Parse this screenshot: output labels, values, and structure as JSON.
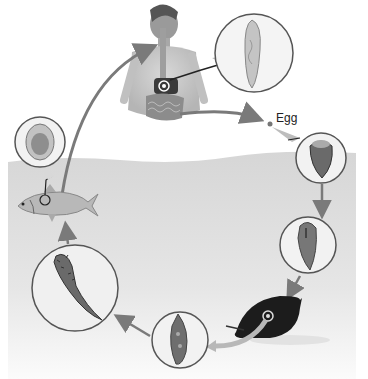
{
  "diagram": {
    "type": "life-cycle",
    "colors": {
      "background": "#ffffff",
      "water": "#dcdcdc",
      "arrow": "#7a7a7a",
      "circle_border": "#555555",
      "circle_fill": "#f2f2f2",
      "snail": "#1c1c1c"
    },
    "labels": {
      "egg": "Egg"
    },
    "stages": [
      {
        "id": "human-host",
        "icon": "human-torso-icon"
      },
      {
        "id": "adult-fluke",
        "icon": "adult-fluke-icon"
      },
      {
        "id": "egg",
        "icon": "egg-dot-icon",
        "label": "Egg"
      },
      {
        "id": "miracidium-in-egg",
        "icon": "egg-capsule-icon"
      },
      {
        "id": "miracidium",
        "icon": "miracidium-icon"
      },
      {
        "id": "snail-host",
        "icon": "snail-icon"
      },
      {
        "id": "redia",
        "icon": "redia-icon"
      },
      {
        "id": "cercaria",
        "icon": "cercaria-icon"
      },
      {
        "id": "fish-host",
        "icon": "fish-icon"
      },
      {
        "id": "metacercaria",
        "icon": "metacercaria-cyst-icon"
      }
    ]
  }
}
